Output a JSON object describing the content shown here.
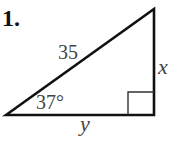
{
  "problem": {
    "number_label": "1."
  },
  "figure": {
    "type": "right-triangle",
    "vertices": {
      "bottom_left": [
        6,
        115
      ],
      "top_right": [
        154,
        9
      ],
      "bottom_right": [
        154,
        115
      ]
    },
    "right_angle_marker": {
      "x": 128,
      "y": 92,
      "size": 23
    },
    "labels": {
      "hypotenuse": "35",
      "angle": "37°",
      "vertical_leg": "x",
      "horizontal_leg": "y"
    },
    "colors": {
      "stroke": "#111111",
      "label": "#444444",
      "background": "#ffffff"
    }
  }
}
